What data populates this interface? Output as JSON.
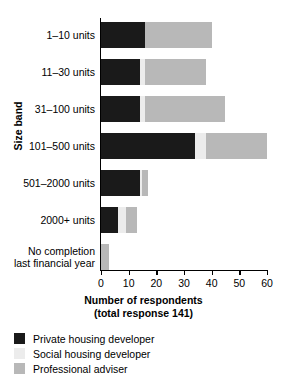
{
  "chart_data": {
    "type": "bar",
    "orientation": "horizontal",
    "stacked": true,
    "title": "",
    "xlabel": "Number of respondents",
    "xlabel_sub": "(total response 141)",
    "ylabel": "Size band",
    "xlim": [
      0,
      60
    ],
    "xticks": [
      0,
      10,
      20,
      30,
      40,
      50,
      60
    ],
    "grid": false,
    "legend_position": "below",
    "categories": [
      "1–10 units",
      "11–30 units",
      "31–100 units",
      "101–500 units",
      "501–2000 units",
      "2000+ units",
      "No completion\nlast financial year"
    ],
    "series": [
      {
        "name": "Private housing developer",
        "color": "#1a1a1a",
        "values": [
          16,
          14,
          14,
          34,
          14,
          6,
          0
        ]
      },
      {
        "name": "Social housing developer",
        "color": "#ececec",
        "values": [
          0,
          2,
          2,
          4,
          1,
          3,
          0
        ]
      },
      {
        "name": "Professional adviser",
        "color": "#b8b8b8",
        "values": [
          24,
          22,
          29,
          22,
          2,
          4,
          3
        ]
      }
    ],
    "totals": [
      40,
      38,
      45,
      60,
      17,
      13,
      3
    ]
  },
  "yaxis": {
    "title": "Size band",
    "labels": [
      {
        "line1": "1–10 units",
        "line2": ""
      },
      {
        "line1": "11–30 units",
        "line2": ""
      },
      {
        "line1": "31–100 units",
        "line2": ""
      },
      {
        "line1": "101–500 units",
        "line2": ""
      },
      {
        "line1": "501–2000 units",
        "line2": ""
      },
      {
        "line1": "2000+ units",
        "line2": ""
      },
      {
        "line1": "No completion",
        "line2": "last financial year"
      }
    ]
  },
  "xaxis": {
    "title_line1": "Number of respondents",
    "title_line2": "(total response 141)",
    "tick_labels": [
      "0",
      "10",
      "20",
      "30",
      "40",
      "50",
      "60"
    ]
  },
  "legend": {
    "items": [
      {
        "label": "Private housing developer",
        "color": "#1a1a1a"
      },
      {
        "label": "Social housing developer",
        "color": "#ececec"
      },
      {
        "label": "Professional adviser",
        "color": "#b8b8b8"
      }
    ]
  }
}
